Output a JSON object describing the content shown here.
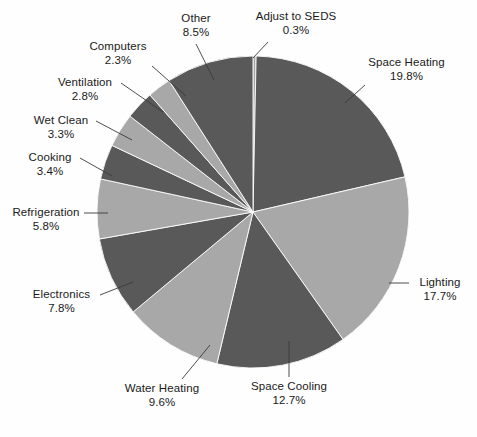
{
  "chart_data": {
    "type": "pie",
    "title": "",
    "subtitle": "",
    "xlabel": "",
    "ylabel": "",
    "legend_position": "none",
    "grid": false,
    "units": "percent",
    "colors": {
      "dark_slice": "#595959",
      "light_slice": "#a8a8a8",
      "background": "#fefefe",
      "label_text": "#1a1a1a",
      "leader_line": "#3a3a3a",
      "slice_border": "#ffffff"
    },
    "geometry": {
      "center_x": 253,
      "center_y": 212,
      "radius": 156,
      "start_angle_deg": 0,
      "direction": "clockwise"
    },
    "categories": [
      "Adjust to SEDS",
      "Space Heating",
      "Lighting",
      "Space Cooling",
      "Water Heating",
      "Electronics",
      "Refrigeration",
      "Cooking",
      "Wet Clean",
      "Ventilation",
      "Computers",
      "Other"
    ],
    "values": [
      0.3,
      19.8,
      17.7,
      12.7,
      9.6,
      7.8,
      5.8,
      3.4,
      3.3,
      2.8,
      2.3,
      8.5
    ],
    "slices": [
      {
        "label": "Adjust to SEDS",
        "value": 0.3,
        "pct_text": "0.3%",
        "tone": "light"
      },
      {
        "label": "Space Heating",
        "value": 19.8,
        "pct_text": "19.8%",
        "tone": "dark"
      },
      {
        "label": "Lighting",
        "value": 17.7,
        "pct_text": "17.7%",
        "tone": "light"
      },
      {
        "label": "Space Cooling",
        "value": 12.7,
        "pct_text": "12.7%",
        "tone": "dark"
      },
      {
        "label": "Water Heating",
        "value": 9.6,
        "pct_text": "9.6%",
        "tone": "light"
      },
      {
        "label": "Electronics",
        "value": 7.8,
        "pct_text": "7.8%",
        "tone": "dark"
      },
      {
        "label": "Refrigeration",
        "value": 5.8,
        "pct_text": "5.8%",
        "tone": "light"
      },
      {
        "label": "Cooking",
        "value": 3.4,
        "pct_text": "3.4%",
        "tone": "dark"
      },
      {
        "label": "Wet Clean",
        "value": 3.3,
        "pct_text": "3.3%",
        "tone": "light"
      },
      {
        "label": "Ventilation",
        "value": 2.8,
        "pct_text": "2.8%",
        "tone": "dark"
      },
      {
        "label": "Computers",
        "value": 2.3,
        "pct_text": "2.3%",
        "tone": "light"
      },
      {
        "label": "Other",
        "value": 8.5,
        "pct_text": "8.5%",
        "tone": "dark"
      }
    ]
  },
  "labels": {
    "other": {
      "name": "Other",
      "pct": "8.5%"
    },
    "adjust_to_seds": {
      "name": "Adjust to SEDS",
      "pct": "0.3%"
    },
    "space_heating": {
      "name": "Space Heating",
      "pct": "19.8%"
    },
    "lighting": {
      "name": "Lighting",
      "pct": "17.7%"
    },
    "space_cooling": {
      "name": "Space Cooling",
      "pct": "12.7%"
    },
    "water_heating": {
      "name": "Water Heating",
      "pct": "9.6%"
    },
    "electronics": {
      "name": "Electronics",
      "pct": "7.8%"
    },
    "refrigeration": {
      "name": "Refrigeration",
      "pct": "5.8%"
    },
    "cooking": {
      "name": "Cooking",
      "pct": "3.4%"
    },
    "wet_clean": {
      "name": "Wet Clean",
      "pct": "3.3%"
    },
    "ventilation": {
      "name": "Ventilation",
      "pct": "2.8%"
    },
    "computers": {
      "name": "Computers",
      "pct": "2.3%"
    }
  }
}
